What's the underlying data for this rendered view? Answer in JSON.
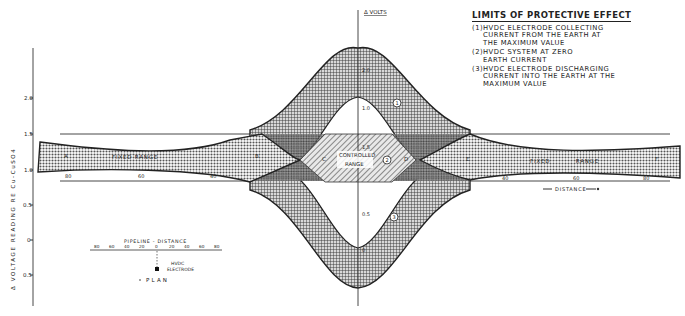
{
  "legend": {
    "title": "LIMITS OF PROTECTIVE EFFECT",
    "items": [
      {
        "num": "(1)",
        "text": "HVDC  ELECTRODE  COLLECTING\nCURRENT  FROM  THE  EARTH  AT\nTHE  MAXIMUM  VALUE"
      },
      {
        "num": "(2)",
        "text": "HVDC  SYSTEM  AT  ZERO\nEARTH  CURRENT"
      },
      {
        "num": "(3)",
        "text": "HVDC  ELECTRODE  DISCHARGING\nCURRENT  INTO  THE  EARTH  AT  THE\nMAXIMUM  VALUE"
      }
    ]
  },
  "axes": {
    "y_label": "Δ VOLTAGE   READING   RE   Cu-CuSO4",
    "y_ticks": [
      "2.0",
      "1.5",
      "1.0",
      "0.5",
      "0",
      "0.5"
    ],
    "center_axis_label": "Δ VOLTS",
    "center_ticks": [
      "2.0",
      "1.0",
      "1.5",
      "0.5",
      "0"
    ],
    "distance_ticks_left": [
      "80",
      "60",
      "40"
    ],
    "distance_ticks_right": [
      "40",
      "60",
      "80"
    ],
    "distance_label": "DISTANCE"
  },
  "regions": {
    "fixed_range_left": "FIXED   RANGE",
    "fixed_range_right": "FIXED          RANGE",
    "controlled_range": [
      "CONTROLLED",
      "RANGE"
    ],
    "point_labels": [
      "A",
      "B",
      "C",
      "D",
      "E",
      "F"
    ],
    "curve_markers": [
      "1",
      "2",
      "3"
    ]
  },
  "plan": {
    "title": "PIPELINE  -  DISTANCE",
    "ticks": [
      "80",
      "60",
      "40",
      "20",
      "0",
      "20",
      "40",
      "60",
      "80"
    ],
    "electrode_label": [
      "HVDC",
      "ELECTRODE"
    ],
    "caption": "PLAN"
  }
}
